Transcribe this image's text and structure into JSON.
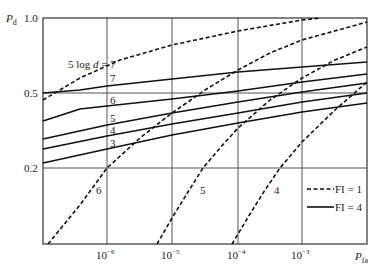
{
  "chart_data": {
    "type": "line",
    "title": "",
    "xlabel": "P_fa",
    "ylabel": "P_d",
    "x_scale": "log",
    "y_scale": "probability",
    "xlim": [
      1e-07,
      0.01
    ],
    "ylim": [
      0.01,
      1.0
    ],
    "x_ticks": [
      "10^-6",
      "10^-5",
      "10^-4",
      "10^-3"
    ],
    "y_ticks": [
      "1.0",
      "0.5",
      "0.2"
    ],
    "grid": true,
    "legend": {
      "position": "lower right",
      "entries": [
        {
          "label": "FI = 1",
          "style": "dashed"
        },
        {
          "label": "FI = 4",
          "style": "solid"
        }
      ]
    },
    "annotation": "5 log d = 7",
    "series": [
      {
        "name": "FI=1, 5 log d = 7",
        "style": "dashed",
        "label": "7",
        "points_px": [
          [
            43,
            100
          ],
          [
            80,
            78
          ],
          [
            120,
            60
          ],
          [
            172,
            45
          ],
          [
            238,
            31
          ],
          [
            302,
            20
          ],
          [
            320,
            18
          ]
        ]
      },
      {
        "name": "FI=1, 5 log d = 6",
        "style": "dashed",
        "label": "6",
        "points_px": [
          [
            48,
            244
          ],
          [
            80,
            205
          ],
          [
            107,
            168
          ],
          [
            140,
            138
          ],
          [
            172,
            113
          ],
          [
            205,
            90
          ],
          [
            238,
            70
          ],
          [
            270,
            53
          ],
          [
            302,
            40
          ],
          [
            367,
            22
          ]
        ]
      },
      {
        "name": "FI=1, 5 log d = 5",
        "style": "dashed",
        "label": "5",
        "points_px": [
          [
            157,
            244
          ],
          [
            172,
            218
          ],
          [
            188,
            192
          ],
          [
            203,
            168
          ],
          [
            220,
            148
          ],
          [
            238,
            128
          ],
          [
            270,
            100
          ],
          [
            302,
            78
          ],
          [
            335,
            60
          ],
          [
            367,
            47
          ]
        ]
      },
      {
        "name": "FI=1, 5 log d = 4",
        "style": "dashed",
        "label": "4",
        "points_px": [
          [
            232,
            244
          ],
          [
            250,
            214
          ],
          [
            265,
            190
          ],
          [
            280,
            168
          ],
          [
            302,
            142
          ],
          [
            335,
            110
          ],
          [
            367,
            82
          ]
        ]
      },
      {
        "name": "FI=4, 5 log d = 7",
        "style": "solid",
        "label": "7",
        "points_px": [
          [
            43,
            93
          ],
          [
            80,
            90
          ],
          [
            107,
            86
          ],
          [
            172,
            79
          ],
          [
            238,
            72
          ],
          [
            302,
            67
          ],
          [
            367,
            62
          ]
        ]
      },
      {
        "name": "FI=4, 5 log d = 6",
        "style": "solid",
        "label": "6",
        "points_px": [
          [
            43,
            121
          ],
          [
            80,
            109
          ],
          [
            107,
            106
          ],
          [
            172,
            99
          ],
          [
            238,
            91
          ],
          [
            302,
            82
          ],
          [
            367,
            74
          ]
        ]
      },
      {
        "name": "FI=4, 5 log d = 5",
        "style": "solid",
        "label": "5",
        "points_px": [
          [
            43,
            139
          ],
          [
            107,
            125
          ],
          [
            172,
            113
          ],
          [
            238,
            102
          ],
          [
            302,
            92
          ],
          [
            367,
            83
          ]
        ]
      },
      {
        "name": "FI=4, 5 log d = 4",
        "style": "solid",
        "label": "4",
        "points_px": [
          [
            43,
            149
          ],
          [
            107,
            136
          ],
          [
            172,
            124
          ],
          [
            238,
            113
          ],
          [
            302,
            102
          ],
          [
            367,
            93
          ]
        ]
      },
      {
        "name": "FI=4, 5 log d = 3",
        "style": "solid",
        "label": "3",
        "points_px": [
          [
            43,
            163
          ],
          [
            107,
            149
          ],
          [
            172,
            135
          ],
          [
            238,
            123
          ],
          [
            302,
            112
          ],
          [
            367,
            103
          ]
        ]
      }
    ]
  },
  "labels": {
    "y_axis": "P",
    "y_axis_sub": "d",
    "x_axis": "P",
    "x_axis_sub": "fa",
    "y_tick_1": "1.0",
    "y_tick_05": "0.5",
    "y_tick_02": "0.2",
    "x_tick_m6_base": "10",
    "x_tick_m6_exp": "−6",
    "x_tick_m5_base": "10",
    "x_tick_m5_exp": "−5",
    "x_tick_m4_base": "10",
    "x_tick_m4_exp": "−4",
    "x_tick_m3_base": "10",
    "x_tick_m3_exp": "−3",
    "annotation_prefix": "5 log ",
    "annotation_var": "d",
    "annotation_suffix": " = 7",
    "solid_7": "7",
    "solid_6": "6",
    "solid_5": "5",
    "solid_4": "4",
    "solid_3": "3",
    "dash_6": "6",
    "dash_5": "5",
    "dash_4": "4",
    "legend_dashed": "FI = 1",
    "legend_solid": "FI = 4"
  }
}
